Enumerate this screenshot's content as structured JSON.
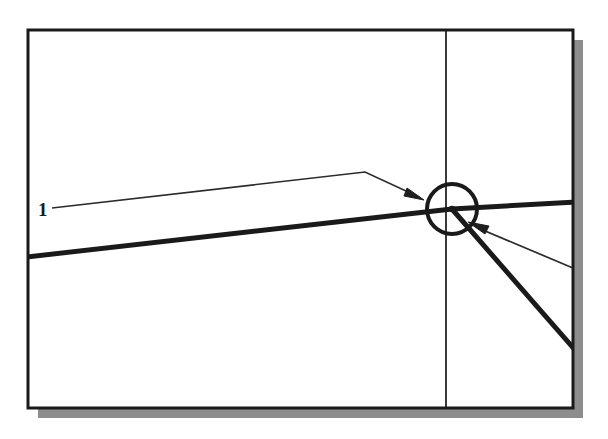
{
  "canvas": {
    "width": 608,
    "height": 439,
    "background_color": "#ffffff"
  },
  "figure": {
    "kind": "cad-line-drawing",
    "frame": {
      "name": "drawing-frame",
      "x": 28,
      "y": 30,
      "width": 545,
      "height": 378,
      "border_color": "#1a1a1a",
      "border_width": 3,
      "fill_color": "#ffffff"
    },
    "shadow": {
      "name": "frame-drop-shadow",
      "offset_x": 10,
      "offset_y": 10,
      "color": "#8d8d8d"
    },
    "vertical_rule": {
      "name": "vertical-construction-line",
      "x": 446,
      "y_top": 30,
      "y_bottom": 408,
      "color": "#3a3a3a",
      "width": 2
    },
    "thick_line_left": {
      "name": "thick-line-left-segment",
      "x1": 28,
      "y1": 257,
      "x2": 452,
      "y2": 209,
      "color": "#1a1a1a",
      "width": 5
    },
    "thick_line_right": {
      "name": "thick-line-right-segment",
      "x1": 452,
      "y1": 209,
      "x2": 573,
      "y2": 203,
      "color": "#1a1a1a",
      "width": 5
    },
    "thick_line_descending": {
      "name": "thick-line-descending-segment",
      "x1": 452,
      "y1": 209,
      "x2": 573,
      "y2": 349,
      "color": "#1a1a1a",
      "width": 5
    },
    "intersection_circle": {
      "name": "intersection-snap-circle",
      "cx": 452,
      "cy": 209,
      "r": 25,
      "color": "#1a1a1a",
      "width": 4,
      "fill": "none"
    },
    "intersection_dot": {
      "name": "intersection-point-marker",
      "cx": 452,
      "cy": 209,
      "r": 3,
      "color": "#1a1a1a"
    },
    "leader_upper": {
      "name": "leader-line-upper",
      "points": "52,208 365,172 420,198",
      "color": "#2b2b2b",
      "width": 1.6,
      "arrow_at": {
        "x": 422,
        "y": 199,
        "angle_deg": 25
      }
    },
    "leader_lower": {
      "name": "leader-line-lower",
      "points": "573,268 474,226",
      "color": "#2b2b2b",
      "width": 1.6,
      "arrow_at": {
        "x": 472,
        "y": 225,
        "angle_deg": 203
      }
    },
    "labels": [
      {
        "name": "vertex-label-1",
        "text": "1",
        "x": 38,
        "y": 216
      }
    ]
  }
}
